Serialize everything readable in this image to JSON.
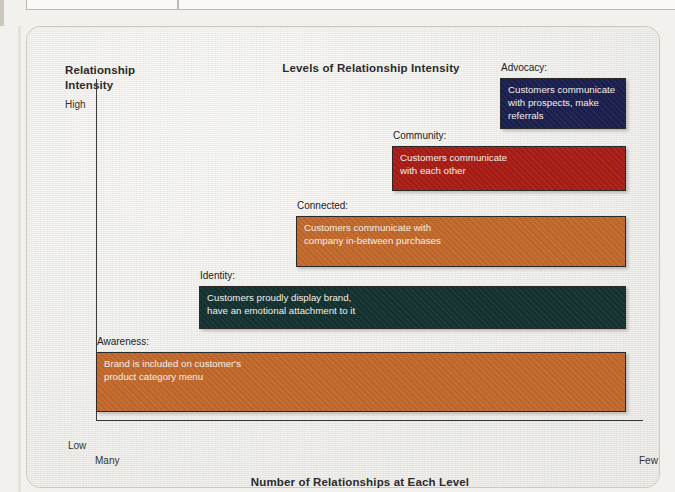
{
  "scan": {
    "clipped_text_top": "",
    "page_bg_color": "#f2f1ee",
    "card_bg_color": "#efeeea",
    "card_border_color": "#cdc8bf"
  },
  "chart_data": {
    "type": "bar",
    "orientation": "horizontal",
    "title": "Levels of Relationship Intensity",
    "xlabel": "Number of Relationships at Each Level",
    "ylabel": "Relationship\nIntensity",
    "ylabel_line1": "Relationship",
    "ylabel_line2": "Intensity",
    "yticks": [
      "High",
      "Low"
    ],
    "xticks": [
      "Many",
      "Few"
    ],
    "grid": false,
    "legend": "none",
    "axis_color": "#3a3a3a",
    "note": "Staircase/pyramid of customer-relationship levels; bar width encodes number of relationships (wide = many, narrow = few), vertical position encodes relationship intensity (high at top).",
    "categories": [
      "Advocacy",
      "Community",
      "Connected",
      "Identity",
      "Awareness"
    ],
    "series": [
      {
        "name": "Relative number of relationships (bar width, % of axis)",
        "values": [
          26,
          45,
          62,
          80,
          95
        ]
      }
    ],
    "bars": [
      {
        "label": "Advocacy:",
        "text": "Customers communicate\nwith prospects, make\nreferrals",
        "color": "#1b1f4e",
        "text_color": "#f3efe8",
        "intensity_rank": 5,
        "width_pct": 26,
        "px": {
          "left": 499,
          "top": 77,
          "width": 126,
          "height": 51
        }
      },
      {
        "label": "Community:",
        "text": "Customers communicate\nwith each other",
        "color": "#a81c16",
        "text_color": "#f3efe8",
        "intensity_rank": 4,
        "width_pct": 45,
        "px": {
          "left": 391,
          "top": 145,
          "width": 234,
          "height": 45
        }
      },
      {
        "label": "Connected:",
        "text": "Customers communicate with\ncompany in-between purchases",
        "color": "#c2692c",
        "text_color": "#f3efe8",
        "intensity_rank": 3,
        "width_pct": 62,
        "px": {
          "left": 295,
          "top": 215,
          "width": 330,
          "height": 51
        }
      },
      {
        "label": "Identity:",
        "text": "Customers proudly display brand,\nhave an emotional attachment to it",
        "color": "#143230",
        "text_color": "#f3efe8",
        "intensity_rank": 2,
        "width_pct": 80,
        "px": {
          "left": 198,
          "top": 285,
          "width": 427,
          "height": 43
        }
      },
      {
        "label": "Awareness:",
        "text": "Brand is included on customer's\nproduct category menu",
        "color": "#c2692c",
        "text_color": "#f3efe8",
        "intensity_rank": 1,
        "width_pct": 95,
        "px": {
          "left": 95,
          "top": 351,
          "width": 530,
          "height": 60
        }
      }
    ]
  }
}
